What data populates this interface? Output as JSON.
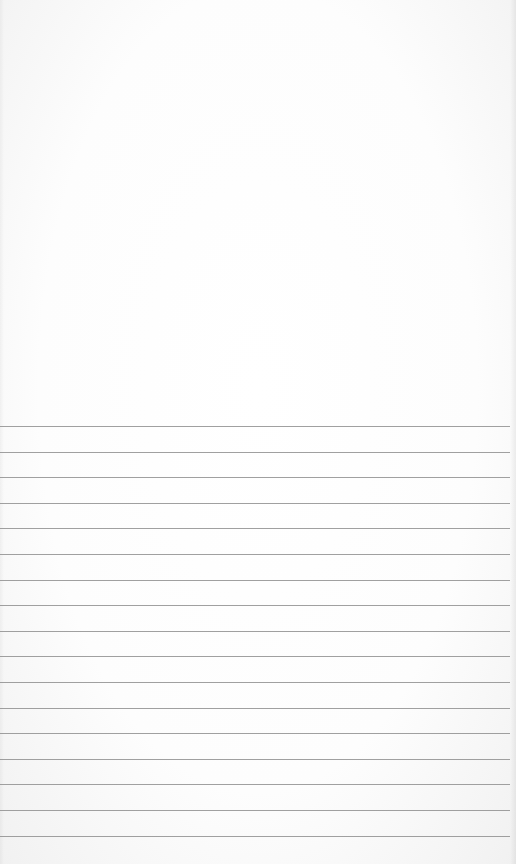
{
  "page": {
    "type": "ruled-paper",
    "background": "#ffffff",
    "rule_color": "#8f8f8f",
    "rules": {
      "count": 17,
      "first_y": 426,
      "spacing": 25.6
    },
    "text": ""
  }
}
